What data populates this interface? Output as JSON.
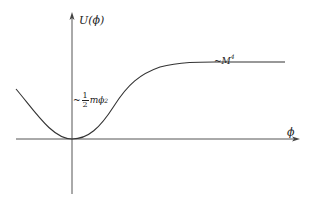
{
  "diagram": {
    "y_axis": {
      "label": "U(ϕ)"
    },
    "x_axis": {
      "label": "ϕ"
    },
    "annotations": {
      "quadratic": {
        "prefix": "~",
        "numerator": "1",
        "denominator": "2",
        "expr": "mϕ",
        "power": "2"
      },
      "plateau": {
        "prefix": "~",
        "expr": "M",
        "power": "4"
      }
    },
    "colors": {
      "axis": "#444444",
      "curve": "#333333",
      "background": "#ffffff"
    }
  }
}
